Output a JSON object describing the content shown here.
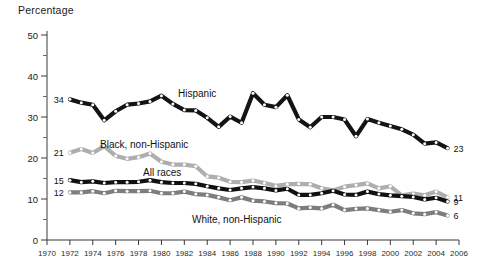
{
  "chart_data": {
    "type": "line",
    "title": "Percentage",
    "xlabel": "",
    "ylabel": "Percentage",
    "xlim": [
      1970,
      2006
    ],
    "ylim": [
      0,
      50
    ],
    "grid": false,
    "legend_position": "inline-labels",
    "y_ticks_major": [
      0,
      10,
      20,
      30,
      40,
      50
    ],
    "y_ticks_minor": [
      5,
      15,
      25,
      35,
      45
    ],
    "x_ticks": [
      1970,
      1972,
      1974,
      1976,
      1978,
      1980,
      1982,
      1984,
      1986,
      1988,
      1990,
      1992,
      1994,
      1996,
      1998,
      2000,
      2002,
      2004,
      2006
    ],
    "x": [
      1972,
      1973,
      1974,
      1975,
      1976,
      1977,
      1978,
      1979,
      1980,
      1981,
      1982,
      1983,
      1984,
      1985,
      1986,
      1987,
      1988,
      1989,
      1990,
      1991,
      1992,
      1993,
      1994,
      1995,
      1996,
      1997,
      1998,
      1999,
      2000,
      2001,
      2002,
      2003,
      2004,
      2005
    ],
    "series": [
      {
        "name": "Hispanic",
        "color": "#141414",
        "marker_fill": "#ffffff",
        "start_label": "34",
        "end_label": "23",
        "label_text": "Hispanic",
        "values": [
          34.3,
          33.5,
          33.0,
          29.2,
          31.4,
          33.0,
          33.3,
          33.8,
          35.2,
          33.2,
          31.7,
          31.6,
          29.8,
          27.6,
          30.1,
          28.6,
          35.8,
          33.0,
          32.4,
          35.3,
          29.4,
          27.5,
          30.0,
          30.0,
          29.4,
          25.3,
          29.5,
          28.6,
          27.8,
          27.0,
          25.7,
          23.5,
          23.8,
          22.4
        ]
      },
      {
        "name": "Black, non-Hispanic",
        "color": "#aeaeae",
        "marker_fill": "#ffffff",
        "start_label": "21",
        "end_label": "11",
        "label_text": "Black, non-Hispanic",
        "values": [
          21.3,
          22.2,
          21.2,
          22.9,
          20.5,
          19.8,
          20.2,
          21.1,
          19.1,
          18.4,
          18.4,
          18.0,
          15.5,
          15.2,
          14.2,
          14.1,
          14.5,
          13.9,
          13.2,
          13.6,
          13.7,
          13.6,
          12.6,
          12.1,
          13.0,
          13.4,
          13.8,
          12.6,
          13.1,
          10.9,
          11.3,
          10.9,
          11.8,
          10.4
        ]
      },
      {
        "name": "All races",
        "color": "#111111",
        "marker_fill": "#ffffff",
        "start_label": "15",
        "end_label": "9",
        "label_text": "All races",
        "values": [
          14.6,
          14.1,
          14.3,
          13.9,
          14.1,
          14.1,
          14.2,
          14.6,
          14.1,
          13.9,
          13.9,
          13.7,
          13.1,
          12.6,
          12.2,
          12.6,
          12.9,
          12.6,
          12.1,
          12.5,
          11.0,
          11.0,
          11.4,
          12.0,
          11.1,
          11.0,
          11.8,
          11.2,
          10.9,
          10.7,
          10.5,
          9.9,
          10.3,
          9.4
        ]
      },
      {
        "name": "White, non-Hispanic",
        "color": "#7d7d7d",
        "marker_fill": "#ffffff",
        "start_label": "12",
        "end_label": "6",
        "label_text": "White, non-Hispanic",
        "values": [
          11.6,
          11.6,
          11.9,
          11.4,
          12.0,
          11.9,
          11.9,
          12.0,
          11.4,
          11.4,
          11.8,
          11.2,
          11.0,
          10.4,
          9.7,
          10.4,
          9.6,
          9.4,
          9.0,
          8.9,
          7.7,
          7.9,
          7.7,
          8.6,
          7.3,
          7.6,
          7.7,
          7.3,
          6.9,
          7.3,
          6.5,
          6.3,
          6.8,
          6.0
        ]
      }
    ]
  },
  "axis": {
    "y_title": "Percentage"
  }
}
